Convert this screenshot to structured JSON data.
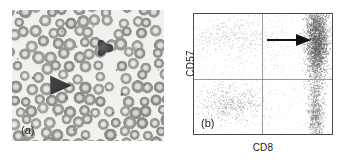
{
  "figure": {
    "background_color": "#ffffff",
    "width": 343,
    "height": 164
  },
  "panel_a": {
    "label": "(a)",
    "kind": "light-microscopy-blood-smear",
    "description": "Peripheral blood smear, Wright-Giemsa stain, showing erythrocytes and two darkly stained large granular lymphocytes",
    "background_color": "#f2f1ef",
    "rbc_fill": "#9d9d9a",
    "rbc_pale_center": "#d8d7d3",
    "dark_cell_color": "#3b3b3b",
    "markers": [
      {
        "name": "dark-lymphocyte-upper",
        "x": 92,
        "y": 38,
        "size": 17
      },
      {
        "name": "dark-lymphocyte-arrowhead",
        "x": 48,
        "y": 75,
        "size": 19
      }
    ]
  },
  "panel_b": {
    "label": "(b)",
    "annotation_arrow": {
      "name": "arrow-pointing-to-cd8-bright-cd57-positive-population",
      "direction": "right",
      "color": "#111111"
    },
    "axis_color": "#4a4a4a",
    "quadrant_line_color": "#9a9a9a",
    "dot_color": "#707070"
  },
  "chart_data": {
    "type": "scatter",
    "title": "",
    "xlabel": "CD8",
    "ylabel": "CD57",
    "xlim": [
      0,
      100
    ],
    "ylim": [
      0,
      100
    ],
    "grid": false,
    "legend": null,
    "quadrant_gates": {
      "x": 49,
      "y": 46,
      "labels": [
        "upper-left",
        "upper-right",
        "lower-left",
        "lower-right"
      ]
    },
    "annotations": [
      {
        "type": "arrow",
        "text": "",
        "from_x": 52,
        "from_y": 84,
        "to_x": 85,
        "to_y": 84,
        "note": "arrow indicates the expanded CD8-bright CD57-positive large granular lymphocyte population"
      }
    ],
    "populations": [
      {
        "name": "cd8-bright-cd57-positive-cluster",
        "quadrant": "upper-right",
        "center_x": 89,
        "center_y": 78,
        "spread_x": 4,
        "spread_y": 16,
        "count": 2600,
        "density": "very-high"
      },
      {
        "name": "cd8-bright-cd57-negative-band",
        "quadrant": "lower-right",
        "center_x": 88,
        "center_y": 18,
        "spread_x": 3,
        "spread_y": 16,
        "count": 900,
        "density": "high"
      },
      {
        "name": "cd57-positive-cd8-dim-scatter",
        "quadrant": "upper-left",
        "center_x": 28,
        "center_y": 82,
        "spread_x": 20,
        "spread_y": 9,
        "count": 520,
        "density": "low"
      },
      {
        "name": "cd8-negative-cd57-negative-lymphocytes",
        "quadrant": "lower-left",
        "center_x": 26,
        "center_y": 25,
        "spread_x": 12,
        "spread_y": 8,
        "count": 700,
        "density": "medium"
      },
      {
        "name": "sparse-background-events",
        "quadrant": "all",
        "center_x": 50,
        "center_y": 55,
        "spread_x": 30,
        "spread_y": 28,
        "count": 420,
        "density": "very-low"
      }
    ]
  }
}
